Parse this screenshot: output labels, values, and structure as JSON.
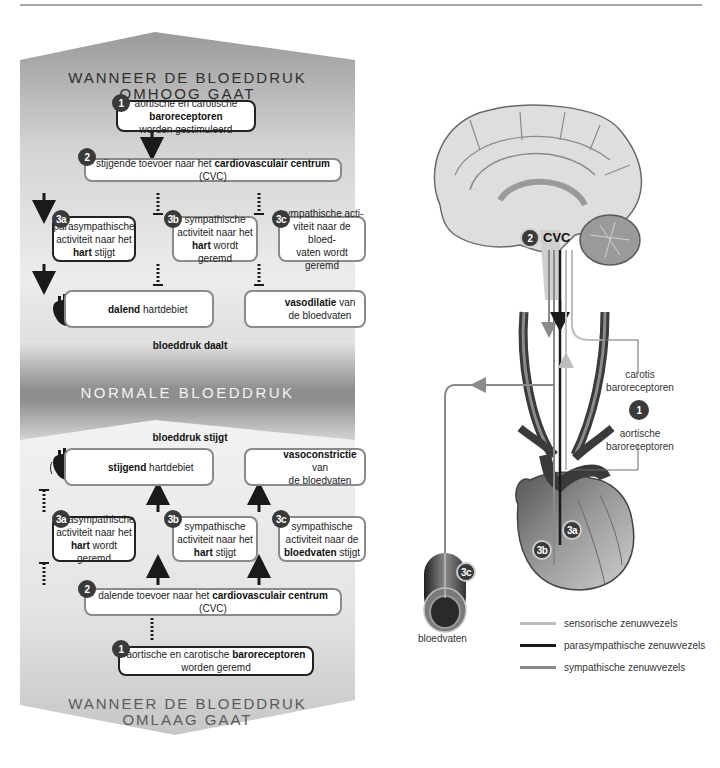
{
  "colors": {
    "panel_dark": "#8c8c8c",
    "panel_light": "#efefef",
    "badge": "#3a3a3a",
    "sensory": "#bdbdbd",
    "parasympathetic": "#1a1a1a",
    "sympathetic": "#8a8a8a"
  },
  "top_section": {
    "heading_line1": "WANNEER DE BLOEDDRUK",
    "heading_line2": "OMHOOG GAAT",
    "step1": {
      "badge": "1",
      "pre": "aortische en carotische ",
      "bold": "baroreceptoren",
      "post": "worden gestimuleerd"
    },
    "step2": {
      "badge": "2",
      "pre": "stijgende toevoer naar het ",
      "bold": "cardiovasculair centrum",
      "post": " (CVC)"
    },
    "step3a": {
      "badge": "3a",
      "line1": "parasympathische",
      "line2": "activiteit naar het",
      "bold": "hart",
      "post": " stijgt"
    },
    "step3b": {
      "badge": "3b",
      "line1": "sympathische",
      "line2": "activiteit naar het",
      "bold": "hart",
      "post": " wordt geremd"
    },
    "step3c": {
      "badge": "3c",
      "line1": "sympathische acti-",
      "line2": "viteit naar de bloed-",
      "line3": "vaten wordt geremd"
    },
    "result_heart": {
      "bold": "dalend",
      "post": " hartdebiet",
      "icon": "heart-icon"
    },
    "result_vessel": {
      "bold": "vasodilatie",
      "post": " van",
      "line2": "de bloedvaten",
      "icon": "vessel-dilated-icon"
    },
    "caption": "bloeddruk daalt"
  },
  "middle": {
    "heading": "NORMALE BLOEDDRUK"
  },
  "bottom_section": {
    "caption": "bloeddruk stijgt",
    "result_heart": {
      "bold": "stijgend",
      "post": " hartdebiet",
      "icon": "heart-beating-icon"
    },
    "result_vessel": {
      "bold": "vasoconstrictie",
      "post": " van",
      "line2": "de bloedvaten",
      "icon": "vessel-constricted-icon"
    },
    "step3a": {
      "badge": "3a",
      "line1": "parasympathische",
      "line2": "activiteit naar het",
      "bold": "hart",
      "post": " wordt geremd"
    },
    "step3b": {
      "badge": "3b",
      "line1": "sympathische",
      "line2": "activiteit naar het",
      "bold": "hart",
      "post": " stijgt"
    },
    "step3c": {
      "badge": "3c",
      "line1": "sympathische",
      "line2": "activiteit naar de",
      "bold": "bloedvaten",
      "post": " stijgt"
    },
    "step2": {
      "badge": "2",
      "pre": "dalende toevoer naar het ",
      "bold": "cardiovasculair centrum",
      "post": " (CVC)"
    },
    "step1": {
      "badge": "1",
      "pre": "aortische en carotische ",
      "bold": "baroreceptoren",
      "post": "worden geremd"
    },
    "heading_line1": "WANNEER DE BLOEDDRUK",
    "heading_line2": "OMLAAG GAAT"
  },
  "anatomy": {
    "cvc_label": "CVC",
    "badge_cvc": "2",
    "carotid_line1": "carotis",
    "carotid_line2": "baroreceptoren",
    "badge_receptors": "1",
    "aortic_line1": "aortische",
    "aortic_line2": "baroreceptoren",
    "badge_3a": "3a",
    "badge_3b": "3b",
    "badge_3c": "3c",
    "vessel_label": "bloedvaten"
  },
  "legend": [
    {
      "label": "sensorische zenuwvezels",
      "color": "#bdbdbd"
    },
    {
      "label": "parasympathische zenuwvezels",
      "color": "#1a1a1a"
    },
    {
      "label": "sympathische zenuwvezels",
      "color": "#8a8a8a"
    }
  ]
}
